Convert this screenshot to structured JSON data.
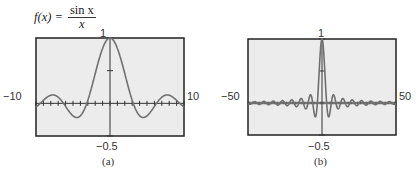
{
  "formula": {
    "lhs": "f(x) =",
    "numerator": "sin x",
    "denominator": "x"
  },
  "colors": {
    "curve": "#707070",
    "axes": "#333333",
    "frame": "#222222",
    "screen_bg": "#ececec"
  },
  "chart_data": [
    {
      "type": "line",
      "title": "f(x) = sin x / x",
      "caption": "(a)",
      "xlim": [
        -10,
        10
      ],
      "ylim": [
        -0.5,
        1
      ],
      "x_tick_step": 1,
      "y_tick_step": 0.5,
      "labels": {
        "xmin": "−10",
        "xmax": "10",
        "ymax": "1",
        "ymin": "−0.5"
      },
      "function": "sin(x)/x",
      "x": [
        -10,
        -8,
        -6,
        -4.49,
        -2,
        0,
        2,
        4.49,
        6,
        8,
        10
      ],
      "y": [
        -0.054,
        0.124,
        -0.047,
        -0.217,
        0.455,
        1,
        0.455,
        -0.217,
        -0.047,
        0.124,
        -0.054
      ]
    },
    {
      "type": "line",
      "title": "f(x) = sin x / x",
      "caption": "(b)",
      "xlim": [
        -50,
        50
      ],
      "ylim": [
        -0.5,
        1
      ],
      "labels": {
        "xmin": "−50",
        "xmax": "50",
        "ymax": "1",
        "ymin": "−0.5"
      },
      "function": "sin(x)/x",
      "x": [
        -50,
        -20,
        -10,
        -4.49,
        0,
        4.49,
        10,
        20,
        50
      ],
      "y": [
        -0.005,
        0.046,
        -0.054,
        -0.217,
        1,
        -0.217,
        -0.054,
        0.046,
        -0.005
      ]
    }
  ],
  "graph_a": {
    "xmin": "−10",
    "xmax": "10",
    "ymax": "1",
    "ymin": "−0.5",
    "caption": "(a)"
  },
  "graph_b": {
    "xmin": "−50",
    "xmax": "50",
    "ymax": "1",
    "ymin": "−0.5",
    "caption": "(b)"
  }
}
